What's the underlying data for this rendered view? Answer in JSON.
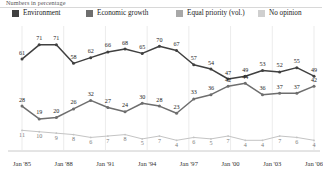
{
  "subtitle": "Numbers in percentage",
  "legend": {
    "items": [
      {
        "label": "Environment",
        "color": "#404040",
        "x": 6
      },
      {
        "label": "Economic growth",
        "color": "#6e6e6e",
        "x": 80
      },
      {
        "label": "Equal priority (vol.)",
        "color": "#a8a8a8",
        "x": 170
      },
      {
        "label": "No opinion",
        "color": "#cfcfcf",
        "x": 252
      }
    ]
  },
  "chart_data": {
    "type": "line",
    "title": "",
    "subtitle": "Numbers in percentage",
    "xlabel": "",
    "ylabel": "",
    "ylim": [
      0,
      80
    ],
    "grid": "vertical",
    "legend_position": "top",
    "x": [
      "Jan '85",
      "Jan '88",
      "Jan '90",
      "Jan '91",
      "Jan '92",
      "Jan '95",
      "Jan '97",
      "Jan '98",
      "Jan '99",
      "Jan '00",
      "Jan '00b",
      "Jan '01",
      "Jan '02",
      "Jan '03",
      "Jan '04",
      "Jan '05",
      "Jan '06",
      "Jan '07",
      "Jan '08",
      "Jan '09",
      "Jan '10",
      "Jan '11"
    ],
    "xtick_labels": [
      "Jan '85",
      "Jan '88",
      "Jan '91",
      "Jan '94",
      "Jan '97",
      "Jan '00",
      "Jan '03",
      "Jan '06"
    ],
    "series": [
      {
        "name": "Environment",
        "color": "#404040",
        "values": [
          61,
          71,
          71,
          58,
          62,
          66,
          68,
          65,
          70,
          67,
          57,
          54,
          47,
          49,
          53,
          52,
          55,
          49,
          null,
          null,
          null,
          null
        ],
        "labels": [
          "61",
          "71",
          "71",
          "58",
          "62",
          "66",
          "68",
          "65",
          "70",
          "67",
          "57",
          "54",
          "47",
          "49",
          "53",
          "52",
          "55",
          "49"
        ]
      },
      {
        "name": "Economic growth",
        "color": "#6e6e6e",
        "values": [
          28,
          19,
          20,
          26,
          32,
          27,
          24,
          30,
          28,
          23,
          33,
          36,
          42,
          44,
          36,
          37,
          37,
          42,
          null,
          null,
          null,
          null
        ],
        "labels": [
          "28",
          "19",
          "20",
          "26",
          "32",
          "27",
          "24",
          "30",
          "28",
          "23",
          "33",
          "36",
          "42",
          "44",
          "36",
          "37",
          "37",
          "42"
        ]
      },
      {
        "name": "No opinion",
        "color": "#c4c4c4",
        "values": [
          11,
          10,
          9,
          8,
          6,
          7,
          8,
          5,
          7,
          4,
          6,
          5,
          7,
          4,
          4,
          7,
          6,
          4,
          null,
          null,
          null,
          null
        ],
        "labels": [
          "11",
          "10",
          "9",
          "8",
          "6",
          "7",
          "8",
          "5",
          "7",
          "4",
          "6",
          "5",
          "7",
          "4",
          "4",
          "7",
          "6",
          "4"
        ]
      }
    ]
  }
}
